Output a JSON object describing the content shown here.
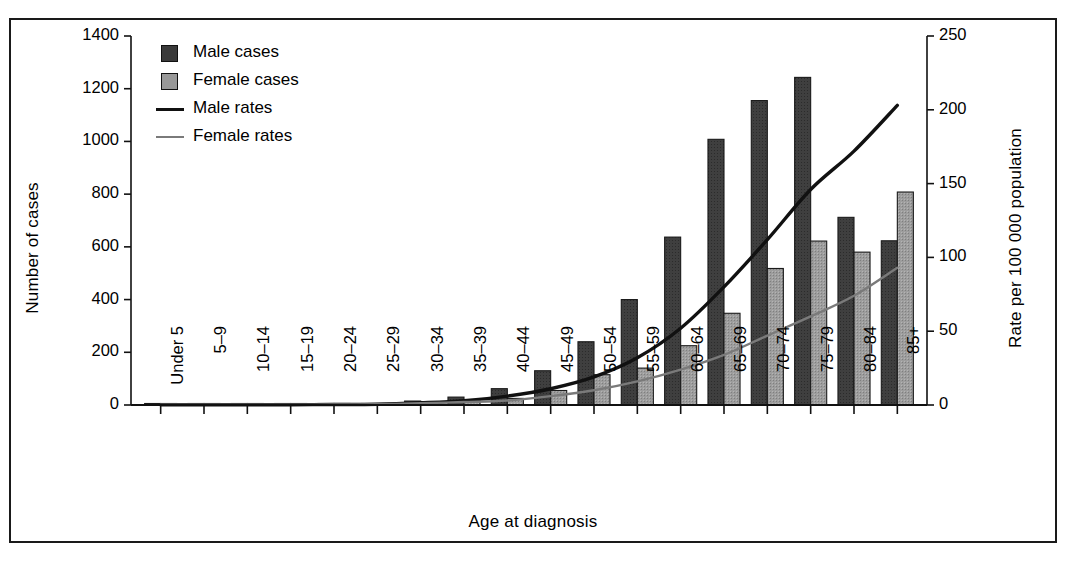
{
  "figure": {
    "border_color": "#1a1a1a",
    "background": "#ffffff"
  },
  "legend": {
    "entries": [
      {
        "label": "Male cases",
        "kind": "swatch",
        "color": "#3a3a3a"
      },
      {
        "label": "Female cases",
        "kind": "swatch",
        "color": "#989898"
      },
      {
        "label": "Male rates",
        "kind": "line",
        "color": "#111111"
      },
      {
        "label": "Female rates",
        "kind": "line",
        "color": "#7a7a7a"
      }
    ]
  },
  "chart_data": {
    "type": "bar",
    "title": "",
    "xlabel": "Age at diagnosis",
    "ylabel": "Number of cases",
    "ylabel_right": "Rate per 100 000 population",
    "ylim": [
      0,
      1400
    ],
    "ylim_right": [
      0,
      250
    ],
    "yticks": [
      0,
      200,
      400,
      600,
      800,
      1000,
      1200,
      1400
    ],
    "yticks_right": [
      0,
      50,
      100,
      150,
      200,
      250
    ],
    "grid": false,
    "legend_position": "top-left",
    "categories": [
      "Under 5",
      "5–9",
      "10–14",
      "15–19",
      "20–24",
      "25–29",
      "30–34",
      "35–39",
      "40–44",
      "45–49",
      "50–54",
      "55–59",
      "60–64",
      "65–69",
      "70–74",
      "75–79",
      "80–84",
      "85+"
    ],
    "series": [
      {
        "name": "Male cases",
        "kind": "bar",
        "axis": "left",
        "color": "#3a3a3a",
        "values": [
          2,
          2,
          2,
          2,
          3,
          5,
          15,
          30,
          62,
          130,
          240,
          400,
          637,
          1008,
          1155,
          1243,
          712,
          623
        ]
      },
      {
        "name": "Female cases",
        "kind": "bar",
        "axis": "left",
        "color": "#989898",
        "values": [
          2,
          2,
          2,
          2,
          3,
          5,
          12,
          18,
          25,
          55,
          115,
          140,
          225,
          348,
          518,
          622,
          580,
          808
        ]
      },
      {
        "name": "Male rates",
        "kind": "line",
        "axis": "right",
        "color": "#111111",
        "values": [
          0.2,
          0.2,
          0.2,
          0.2,
          0.3,
          0.5,
          1.5,
          3,
          6,
          11,
          19,
          32,
          52,
          80,
          112,
          146,
          172,
          203
        ]
      },
      {
        "name": "Female rates",
        "kind": "line",
        "axis": "right",
        "color": "#7a7a7a",
        "values": [
          0.2,
          0.2,
          0.2,
          0.2,
          0.3,
          0.5,
          1.2,
          2,
          3,
          6,
          10,
          16,
          24,
          34,
          47,
          60,
          74,
          93
        ]
      }
    ]
  }
}
